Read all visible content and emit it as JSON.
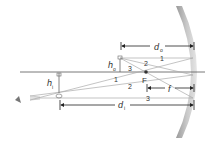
{
  "diagram": {
    "labels": {
      "object_distance": "d",
      "object_distance_sub": "o",
      "image_distance": "d",
      "image_distance_sub": "i",
      "object_height": "h",
      "object_height_sub": "o",
      "image_height": "h",
      "image_height_sub": "i",
      "focal_length": "f",
      "focal_point": "F"
    },
    "rays": [
      {
        "id": "1",
        "label": "1"
      },
      {
        "id": "2",
        "label": "2"
      },
      {
        "id": "3",
        "label": "3"
      }
    ],
    "ray_labels_lower": [
      "1",
      "2",
      "3"
    ],
    "colors": {
      "mirror": "#a8a8a8",
      "mirror_light": "#d9d9d9",
      "axis": "#555555",
      "ray": "#999999",
      "dimension": "#222222"
    }
  }
}
